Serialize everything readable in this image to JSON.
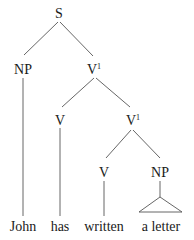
{
  "diagram": {
    "type": "syntax-tree",
    "nodes": {
      "S": {
        "label": "S",
        "sup": ""
      },
      "NP1": {
        "label": "NP",
        "sup": ""
      },
      "Vbar1": {
        "label": "V",
        "sup": "1"
      },
      "V1": {
        "label": "V",
        "sup": ""
      },
      "Vbar2": {
        "label": "V",
        "sup": "1"
      },
      "V2": {
        "label": "V",
        "sup": ""
      },
      "NP2": {
        "label": "NP",
        "sup": ""
      }
    },
    "words": [
      "John",
      "has",
      "written",
      "a letter"
    ],
    "edges": [
      [
        "S",
        "NP1"
      ],
      [
        "S",
        "Vbar1"
      ],
      [
        "Vbar1",
        "V1"
      ],
      [
        "Vbar1",
        "Vbar2"
      ],
      [
        "Vbar2",
        "V2"
      ],
      [
        "Vbar2",
        "NP2"
      ],
      [
        "NP1",
        "John"
      ],
      [
        "V1",
        "has"
      ],
      [
        "V2",
        "written"
      ],
      [
        "NP2",
        "a letter (triangle)"
      ]
    ]
  }
}
